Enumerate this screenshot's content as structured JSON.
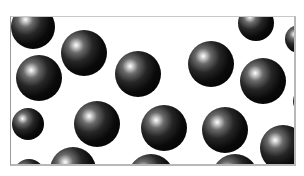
{
  "scene": {
    "description": "Black glossy spheres scattered on a white background inside a thin gray frame",
    "frame": {
      "x": 10,
      "y": 16,
      "width": 286,
      "height": 150,
      "border_color": "#b8b8b8",
      "background": "#ffffff"
    },
    "sphere_color": "#000000",
    "highlight_color": "#ffffff",
    "spheres": [
      {
        "cx": 22,
        "cy": 10,
        "r": 22
      },
      {
        "cx": 73,
        "cy": 36,
        "r": 23
      },
      {
        "cx": 28,
        "cy": 61,
        "r": 23
      },
      {
        "cx": 127,
        "cy": 57,
        "r": 23
      },
      {
        "cx": 200,
        "cy": 47,
        "r": 23
      },
      {
        "cx": 252,
        "cy": 64,
        "r": 23
      },
      {
        "cx": 245,
        "cy": 6,
        "r": 18
      },
      {
        "cx": 288,
        "cy": 22,
        "r": 14
      },
      {
        "cx": 86,
        "cy": 107,
        "r": 23
      },
      {
        "cx": 153,
        "cy": 111,
        "r": 23
      },
      {
        "cx": 214,
        "cy": 113,
        "r": 23
      },
      {
        "cx": 296,
        "cy": 84,
        "r": 14
      },
      {
        "cx": 17,
        "cy": 107,
        "r": 16
      },
      {
        "cx": 62,
        "cy": 153,
        "r": 23
      },
      {
        "cx": 140,
        "cy": 160,
        "r": 23
      },
      {
        "cx": 224,
        "cy": 160,
        "r": 23
      },
      {
        "cx": 272,
        "cy": 131,
        "r": 23
      },
      {
        "cx": 18,
        "cy": 158,
        "r": 16
      }
    ]
  }
}
